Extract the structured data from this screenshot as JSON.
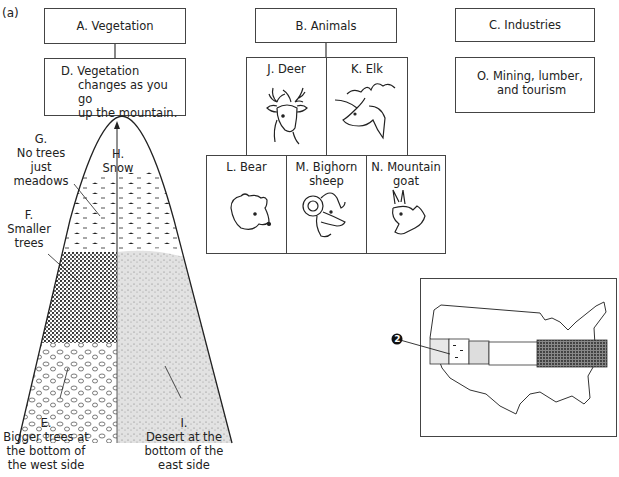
{
  "part_label": "(a)",
  "concept_map": {
    "vegetation": {
      "title": "A. Vegetation",
      "detail_lines": [
        "D. Vegetation",
        "changes as you go",
        "up the mountain."
      ]
    },
    "animals": {
      "title": "B. Animals",
      "items": [
        {
          "label": "J. Deer",
          "icon": "deer-head-icon"
        },
        {
          "label": "K. Elk",
          "icon": "elk-head-icon"
        },
        {
          "label": "L. Bear",
          "icon": "bear-head-icon"
        },
        {
          "label_lines": [
            "M. Bighorn",
            "sheep"
          ],
          "icon": "bighorn-sheep-head-icon"
        },
        {
          "label_lines": [
            "N. Mountain",
            "goat"
          ],
          "icon": "mountain-goat-head-icon"
        }
      ]
    },
    "industries": {
      "title": "C. Industries",
      "detail_lines": [
        "O. Mining, lumber,",
        "and tourism"
      ]
    }
  },
  "mountain": {
    "labels": {
      "G": [
        "G.",
        "No trees",
        "just",
        "meadows"
      ],
      "H": [
        "H.",
        "Snow"
      ],
      "F": [
        "F.",
        "Smaller",
        "trees"
      ],
      "E": [
        "E.",
        "Bigger trees at",
        "the bottom of",
        "the west side"
      ],
      "I": [
        "I.",
        "Desert at the",
        "bottom of the",
        "east side"
      ]
    }
  },
  "map": {
    "marker": "2"
  }
}
